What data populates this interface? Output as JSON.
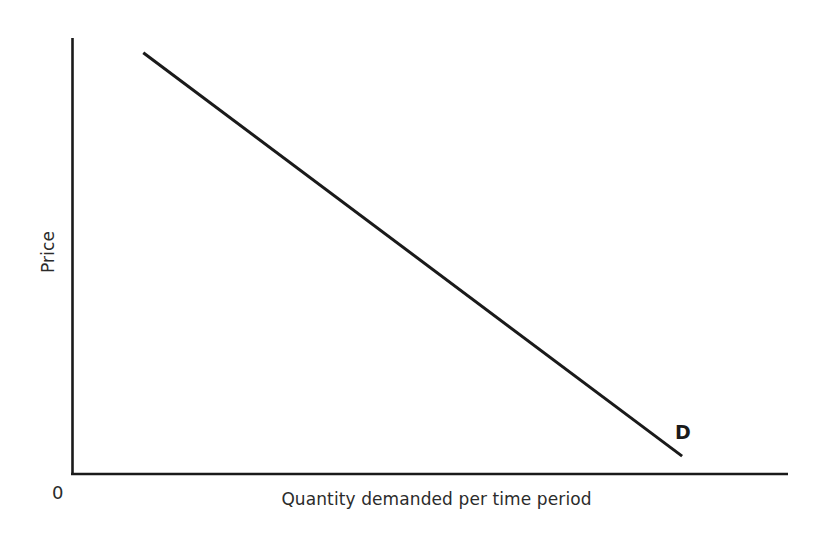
{
  "figure": {
    "background_color": "#ffffff",
    "line_color": "#1a1a1a",
    "text_color": "#2b2b2b",
    "origin_label": "0",
    "curve_label": "D"
  },
  "chart_data": {
    "type": "line",
    "title": "",
    "subtitle": "",
    "xlabel": "Quantity demanded per time period",
    "ylabel": "Price",
    "xlim": [
      0,
      100
    ],
    "ylim": [
      0,
      100
    ],
    "grid": false,
    "legend_position": "none",
    "xticks": [],
    "yticks": [],
    "xticklabels": [],
    "yticklabels": [],
    "annotations": [
      {
        "text": "D",
        "x": 85,
        "y": 10
      },
      {
        "text": "0",
        "x": 0,
        "y": 0
      }
    ],
    "series": [
      {
        "name": "D",
        "label": "D",
        "color": "#1a1a1a",
        "x": [
          9.9,
          85.2
        ],
        "y": [
          96.6,
          4.1
        ],
        "points": [
          {
            "x": 9.9,
            "y": 96.6
          },
          {
            "x": 85.2,
            "y": 4.1
          }
        ]
      }
    ]
  }
}
